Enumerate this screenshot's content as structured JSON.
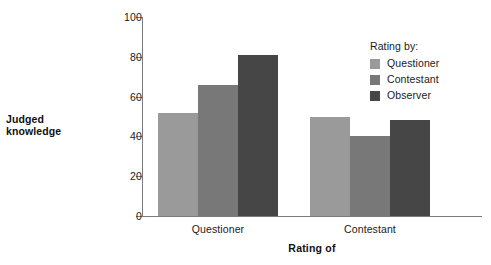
{
  "chart_data": {
    "type": "bar",
    "title": "",
    "xlabel": "Rating of",
    "ylabel": "Judged knowledge",
    "categories": [
      "Questioner",
      "Contestant"
    ],
    "series": [
      {
        "name": "Questioner",
        "values": [
          52,
          50
        ],
        "color": "#9a9a9a"
      },
      {
        "name": "Contestant",
        "values": [
          66,
          40
        ],
        "color": "#787878"
      },
      {
        "name": "Observer",
        "values": [
          81,
          48
        ],
        "color": "#464646"
      }
    ],
    "ylim": [
      0,
      100
    ],
    "yticks": [
      0,
      20,
      40,
      60,
      80,
      100
    ],
    "ytick_labels": [
      "0",
      "20",
      "40",
      "60",
      "80",
      "100"
    ],
    "grid": false,
    "legend_position": "top-right",
    "legend_title": "Rating by:",
    "axis_color": "#7a7a7a",
    "background": "#ffffff"
  },
  "legend": {
    "title": "Rating by:",
    "entries": [
      {
        "label": "Questioner",
        "color": "#9a9a9a"
      },
      {
        "label": "Contestant",
        "color": "#787878"
      },
      {
        "label": "Observer",
        "color": "#464646"
      }
    ]
  }
}
